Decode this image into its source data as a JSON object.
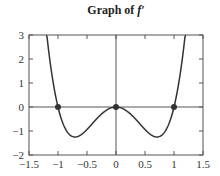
{
  "chart_data": {
    "type": "line",
    "title": "Graph of f′",
    "title_prefix": "Graph of ",
    "title_function": "f′",
    "xlabel": "",
    "ylabel": "",
    "xlim": [
      -1.5,
      1.5
    ],
    "ylim": [
      -2,
      3
    ],
    "xticks": [
      -1.5,
      -1,
      -0.5,
      0,
      0.5,
      1,
      1.5
    ],
    "xtick_labels": [
      "−1.5",
      "−1",
      "−0.5",
      "0",
      "0.5",
      "1",
      "1.5"
    ],
    "yticks": [
      -2,
      -1,
      0,
      1,
      2,
      3
    ],
    "ytick_labels": [
      "−2",
      "−1",
      "0",
      "1",
      "2",
      "3"
    ],
    "grid": false,
    "axes_lines": {
      "x_axis_at_y": 0,
      "y_axis_at_x": 0
    },
    "series": [
      {
        "name": "f′(x)",
        "description": "approx. 5x²(x²−1)",
        "x": [
          -1.2,
          -1.1,
          -1.0,
          -0.9,
          -0.8,
          -0.707,
          -0.6,
          -0.5,
          -0.4,
          -0.3,
          -0.2,
          -0.1,
          0,
          0.1,
          0.2,
          0.3,
          0.4,
          0.5,
          0.6,
          0.707,
          0.8,
          0.9,
          1.0,
          1.1,
          1.2
        ],
        "y": [
          3.17,
          1.27,
          0,
          -0.77,
          -1.15,
          -1.25,
          -1.15,
          -0.94,
          -0.67,
          -0.41,
          -0.19,
          -0.05,
          0,
          -0.05,
          -0.19,
          -0.41,
          -0.67,
          -0.94,
          -1.15,
          -1.25,
          -1.15,
          -0.77,
          0,
          1.27,
          3.17
        ]
      }
    ],
    "marked_points": [
      {
        "x": -1,
        "y": 0
      },
      {
        "x": 0,
        "y": 0
      },
      {
        "x": 1,
        "y": 0
      }
    ],
    "colors": {
      "curve": "#333333",
      "axes": "#555555",
      "points": "#333333"
    }
  }
}
